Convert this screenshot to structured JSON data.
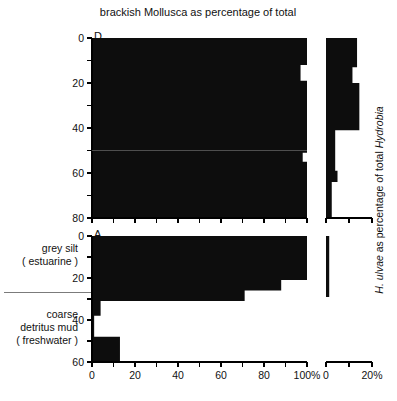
{
  "figure": {
    "title": "brackish Mollusca as percentage of total",
    "right_axis_label_part1": "H. ulvae",
    "right_axis_label_part2": " as percentage of total ",
    "right_axis_label_part3": "Hydrobia",
    "panel_letters": {
      "upper": "D",
      "lower": "A"
    },
    "stratigraphy": {
      "upper_label_line1": "grey silt",
      "upper_label_line2": "( estuarine )",
      "lower_label_line1": "coarse",
      "lower_label_line2": "detritus mud",
      "lower_label_line3": "( freshwater )"
    },
    "colors": {
      "bar": "#0d0d0d",
      "axis": "#000000",
      "background": "#ffffff"
    }
  },
  "chart_data": [
    {
      "id": "panel-D-mollusca",
      "type": "area",
      "title": "brackish Mollusca as percentage of total",
      "xlabel": "",
      "ylabel": "",
      "orientation": "horizontal-depth",
      "xlim": [
        0,
        100
      ],
      "ylim": [
        0,
        80
      ],
      "y_inverted": true,
      "xticks": [
        0,
        10,
        20,
        30,
        40,
        50,
        60,
        70,
        80,
        90,
        100
      ],
      "xticklabels": [
        "0",
        "",
        "20",
        "",
        "40",
        "",
        "60",
        "",
        "80",
        "",
        "100%"
      ],
      "yticks": [
        0,
        10,
        20,
        30,
        40,
        50,
        60,
        70,
        80
      ],
      "yticklabels": [
        "0",
        "",
        "20",
        "",
        "40",
        "",
        "60",
        "",
        "80"
      ],
      "grid": false,
      "legend": null,
      "steps": [
        {
          "depth_top": 0,
          "depth_bottom": 12,
          "value": 100
        },
        {
          "depth_top": 12,
          "depth_bottom": 19,
          "value": 97
        },
        {
          "depth_top": 19,
          "depth_bottom": 51,
          "value": 100
        },
        {
          "depth_top": 51,
          "depth_bottom": 55,
          "value": 98
        },
        {
          "depth_top": 55,
          "depth_bottom": 80,
          "value": 100
        }
      ]
    },
    {
      "id": "panel-D-hydrobia",
      "type": "area",
      "title": "",
      "xlabel": "",
      "ylabel": "H. ulvae as percentage of total Hydrobia",
      "orientation": "horizontal-depth",
      "xlim": [
        0,
        20
      ],
      "ylim": [
        0,
        80
      ],
      "y_inverted": true,
      "xticks": [
        0,
        10,
        20
      ],
      "xticklabels": [
        "0",
        "",
        "20%"
      ],
      "yticks": [
        0,
        10,
        20,
        30,
        40,
        50,
        60,
        70,
        80
      ],
      "yticklabels": [
        "",
        "",
        "",
        "",
        "",
        "",
        "",
        "",
        ""
      ],
      "grid": false,
      "legend": null,
      "steps": [
        {
          "depth_top": 0,
          "depth_bottom": 13,
          "value": 13.5
        },
        {
          "depth_top": 13,
          "depth_bottom": 20,
          "value": 11.5
        },
        {
          "depth_top": 20,
          "depth_bottom": 41,
          "value": 14.5
        },
        {
          "depth_top": 41,
          "depth_bottom": 59,
          "value": 4.0
        },
        {
          "depth_top": 59,
          "depth_bottom": 64,
          "value": 5.0
        },
        {
          "depth_top": 64,
          "depth_bottom": 80,
          "value": 2.5
        }
      ]
    },
    {
      "id": "panel-A-mollusca",
      "type": "area",
      "title": "",
      "xlabel": "",
      "ylabel": "",
      "orientation": "horizontal-depth",
      "xlim": [
        0,
        100
      ],
      "ylim": [
        0,
        60
      ],
      "y_inverted": true,
      "xticks": [
        0,
        10,
        20,
        30,
        40,
        50,
        60,
        70,
        80,
        90,
        100
      ],
      "xticklabels": [
        "0",
        "",
        "20",
        "",
        "40",
        "",
        "60",
        "",
        "80",
        "",
        "100%"
      ],
      "yticks": [
        0,
        10,
        20,
        30,
        40,
        50,
        60
      ],
      "yticklabels": [
        "0",
        "",
        "20",
        "",
        "40",
        "",
        "60"
      ],
      "grid": false,
      "legend": null,
      "steps": [
        {
          "depth_top": 0,
          "depth_bottom": 21,
          "value": 100
        },
        {
          "depth_top": 21,
          "depth_bottom": 26,
          "value": 88
        },
        {
          "depth_top": 26,
          "depth_bottom": 31,
          "value": 71
        },
        {
          "depth_top": 31,
          "depth_bottom": 38,
          "value": 4
        },
        {
          "depth_top": 38,
          "depth_bottom": 48,
          "value": 1
        },
        {
          "depth_top": 48,
          "depth_bottom": 60,
          "value": 13
        }
      ]
    },
    {
      "id": "panel-A-hydrobia",
      "type": "area",
      "title": "",
      "xlabel": "",
      "ylabel": "",
      "orientation": "horizontal-depth",
      "xlim": [
        0,
        20
      ],
      "ylim": [
        0,
        60
      ],
      "y_inverted": true,
      "xticks": [
        0,
        10,
        20
      ],
      "xticklabels": [
        "0",
        "",
        "20%"
      ],
      "yticks": [
        0,
        10,
        20,
        30,
        40,
        50,
        60
      ],
      "yticklabels": [
        "",
        "",
        "",
        "",
        "",
        "",
        ""
      ],
      "grid": false,
      "legend": null,
      "steps": [
        {
          "depth_top": 0,
          "depth_bottom": 29,
          "value": 1.4
        },
        {
          "depth_top": 29,
          "depth_bottom": 60,
          "value": 0.0
        }
      ]
    }
  ]
}
